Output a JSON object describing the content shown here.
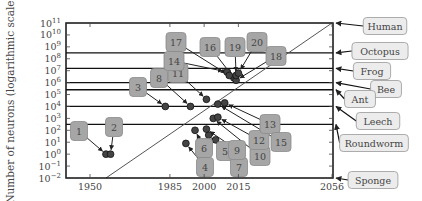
{
  "chart_data": {
    "type": "scatter",
    "title": "",
    "xlabel": "",
    "ylabel": "Number of neurons (logarithmic scale)",
    "xlim": [
      1940,
      2056
    ],
    "ylim_exp": [
      -2,
      11
    ],
    "x_ticks": [
      1950,
      1985,
      2000,
      2015,
      2056
    ],
    "y_tick_exponents": [
      11,
      10,
      9,
      8,
      7,
      6,
      5,
      4,
      3,
      2,
      1,
      0,
      -1,
      -2
    ],
    "trend_line": {
      "from": {
        "year": 1957,
        "exp": -2
      },
      "to": {
        "year": 2056,
        "exp": 11
      }
    },
    "reference_levels": [
      {
        "name": "Human",
        "exp": 11.0
      },
      {
        "name": "Octopus",
        "exp": 8.5
      },
      {
        "name": "Frog",
        "exp": 7.2
      },
      {
        "name": "Bee",
        "exp": 6.0
      },
      {
        "name": "Ant",
        "exp": 5.4
      },
      {
        "name": "Leech",
        "exp": 4.0
      },
      {
        "name": "Roundworm",
        "exp": 2.5
      },
      {
        "name": "Sponge",
        "exp": -2.0
      }
    ],
    "points": [
      {
        "label": "1",
        "year": 1957,
        "exp": 0.0,
        "box": [
          79,
          131
        ]
      },
      {
        "label": "2",
        "year": 1959,
        "exp": 0.0,
        "box": [
          114,
          127
        ]
      },
      {
        "label": "3",
        "year": 1983,
        "exp": 4.0,
        "box": [
          138,
          87
        ]
      },
      {
        "label": "4",
        "year": 1992,
        "exp": 0.9,
        "box": [
          205,
          167
        ]
      },
      {
        "label": "5",
        "year": 2005,
        "exp": 1.2,
        "box": [
          225,
          151
        ]
      },
      {
        "label": "6",
        "year": 1996,
        "exp": 2.0,
        "box": [
          204,
          148
        ]
      },
      {
        "label": "7",
        "year": 2002,
        "exp": 1.6,
        "box": [
          239,
          167
        ]
      },
      {
        "label": "8",
        "year": 1994,
        "exp": 4.0,
        "box": [
          159,
          78
        ]
      },
      {
        "label": "9",
        "year": 2001,
        "exp": 2.1,
        "box": [
          237,
          150
        ]
      },
      {
        "label": "10",
        "year": 2004,
        "exp": 3.0,
        "box": [
          260,
          156
        ]
      },
      {
        "label": "11",
        "year": 2001,
        "exp": 4.6,
        "box": [
          178,
          73
        ]
      },
      {
        "label": "12",
        "year": 2006,
        "exp": 3.1,
        "box": [
          259,
          140
        ]
      },
      {
        "label": "13",
        "year": 2009,
        "exp": 4.3,
        "box": [
          270,
          124
        ]
      },
      {
        "label": "14",
        "year": 2010,
        "exp": 6.9,
        "box": [
          174,
          61
        ]
      },
      {
        "label": "15",
        "year": 2006,
        "exp": 4.2,
        "box": [
          281,
          142
        ]
      },
      {
        "label": "16",
        "year": 2013,
        "exp": 6.4,
        "box": [
          210,
          47
        ]
      },
      {
        "label": "17",
        "year": 2011,
        "exp": 6.6,
        "box": [
          176,
          42
        ]
      },
      {
        "label": "18",
        "year": 2014,
        "exp": 6.2,
        "box": [
          276,
          56
        ]
      },
      {
        "label": "19",
        "year": 2014,
        "exp": 6.6,
        "box": [
          235,
          47
        ]
      },
      {
        "label": "20",
        "year": 2015,
        "exp": 6.8,
        "box": [
          257,
          42
        ]
      }
    ]
  },
  "axis": {
    "ylabel": "Number of neurons (logarithmic scale)",
    "x_tick_labels": [
      "1950",
      "1985",
      "2000",
      "2015",
      "2056"
    ]
  }
}
